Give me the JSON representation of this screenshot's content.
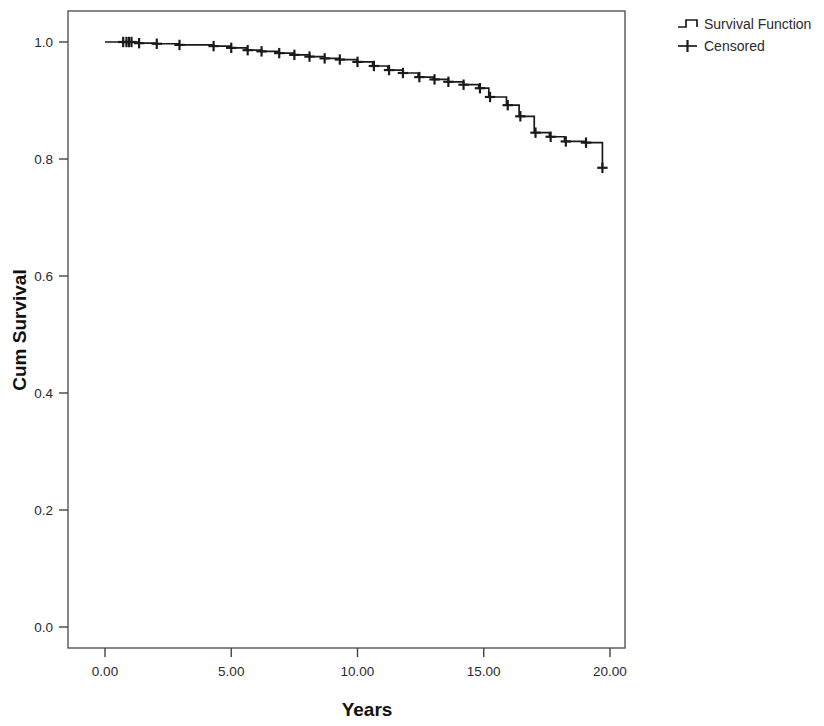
{
  "figure": {
    "background_color": "#ffffff",
    "line_color": "#1a1a1a"
  },
  "legend": {
    "position": "top-right",
    "items": [
      {
        "label": "Survival Function",
        "marker": "step-line-icon"
      },
      {
        "label": "Censored",
        "marker": "plus-tick-icon"
      }
    ]
  },
  "chart_data": {
    "type": "line",
    "subtype": "kaplan-meier-step",
    "title": "",
    "xlabel": "Years",
    "ylabel": "Cum Survival",
    "xlim": [
      -0.85,
      20.6
    ],
    "ylim": [
      -0.024,
      1.035
    ],
    "xticks": [
      0,
      5,
      10,
      15,
      20
    ],
    "xticklabels": [
      "0.00",
      "5.00",
      "10.00",
      "15.00",
      "20.00"
    ],
    "yticks": [
      0.0,
      0.2,
      0.4,
      0.6,
      0.8,
      1.0
    ],
    "yticklabels": [
      "0.0",
      "0.2",
      "0.4",
      "0.6",
      "0.8",
      "1.0"
    ],
    "grid": false,
    "frame": true,
    "series": [
      {
        "name": "Survival Function",
        "style": "step-post",
        "x": [
          0.0,
          0.7,
          1.0,
          1.3,
          2.0,
          2.9,
          4.3,
          5.0,
          5.6,
          6.2,
          6.9,
          7.5,
          8.1,
          8.7,
          9.3,
          10.0,
          10.6,
          11.2,
          11.8,
          12.4,
          13.0,
          13.6,
          14.2,
          14.8,
          15.2,
          15.9,
          16.4,
          17.0,
          17.6,
          18.2,
          19.0,
          19.7
        ],
        "y": [
          1.0,
          1.0,
          1.0,
          0.998,
          0.997,
          0.995,
          0.993,
          0.99,
          0.986,
          0.984,
          0.981,
          0.978,
          0.975,
          0.972,
          0.97,
          0.966,
          0.959,
          0.952,
          0.947,
          0.94,
          0.936,
          0.932,
          0.927,
          0.921,
          0.906,
          0.892,
          0.873,
          0.845,
          0.838,
          0.83,
          0.828,
          0.785
        ]
      },
      {
        "name": "Censored",
        "style": "plus-markers",
        "x": [
          0.72,
          0.85,
          0.95,
          1.05,
          1.35,
          2.05,
          2.95,
          4.3,
          5.0,
          5.65,
          6.2,
          6.9,
          7.5,
          8.1,
          8.7,
          9.3,
          10.0,
          10.65,
          11.25,
          11.8,
          12.45,
          13.05,
          13.6,
          14.2,
          14.85,
          15.25,
          15.95,
          16.45,
          17.05,
          17.65,
          18.25,
          19.05,
          19.7
        ],
        "y": [
          1.0,
          1.0,
          1.0,
          1.0,
          0.998,
          0.997,
          0.995,
          0.993,
          0.99,
          0.986,
          0.984,
          0.981,
          0.978,
          0.975,
          0.972,
          0.97,
          0.966,
          0.959,
          0.952,
          0.947,
          0.94,
          0.936,
          0.932,
          0.927,
          0.921,
          0.906,
          0.892,
          0.873,
          0.845,
          0.838,
          0.83,
          0.828,
          0.785
        ]
      }
    ]
  }
}
